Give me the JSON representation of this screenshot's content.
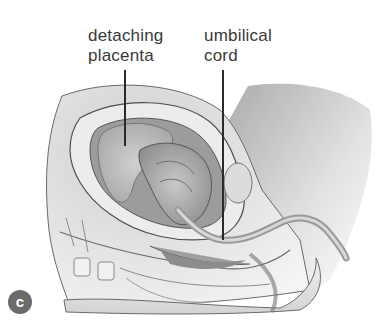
{
  "figure": {
    "panel_letter": "c",
    "badge_color": "#6b6b6b",
    "labels": [
      {
        "line1": "detaching",
        "line2": "placenta",
        "target": "placenta"
      },
      {
        "line1": "umbilical",
        "line2": "cord",
        "target": "umbilical cord"
      }
    ],
    "palette": {
      "skin_light": "#ededed",
      "tissue_mid": "#bdbdbd",
      "tissue_dark": "#8a8a8a",
      "outline": "#5a5a5a",
      "leader_line": "#2a2a2a",
      "text": "#3a3a3a"
    }
  }
}
